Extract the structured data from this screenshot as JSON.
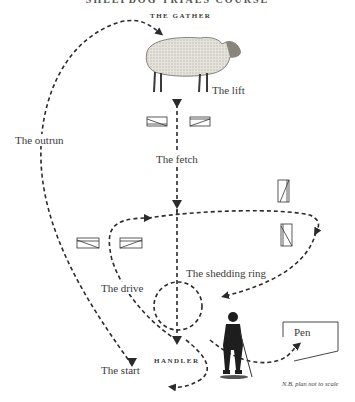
{
  "title": "SHEEPDOG TRIALS COURSE",
  "labels": {
    "gather": "THE GATHER",
    "lift": "The lift",
    "fetch": "The fetch",
    "outrun": "The outrun",
    "drive": "The drive",
    "shedding_ring": "The shedding ring",
    "start": "The start",
    "handler": "HANDLER",
    "pen": "Pen",
    "note": "N.B. plan not to scale"
  },
  "colors": {
    "ink": "#2b2b2b",
    "sheep_wool": "#d9d6cf",
    "handler": "#1e1e1e"
  },
  "obstacles": [
    {
      "name": "fetch-gate-left",
      "x": 147,
      "y": 117,
      "w": 20,
      "h": 9,
      "orientation": "horizontal"
    },
    {
      "name": "fetch-gate-right",
      "x": 190,
      "y": 117,
      "w": 20,
      "h": 9,
      "orientation": "horizontal"
    },
    {
      "name": "drive-gate-left",
      "x": 77,
      "y": 238,
      "w": 22,
      "h": 10,
      "orientation": "horizontal"
    },
    {
      "name": "drive-gate-right",
      "x": 120,
      "y": 238,
      "w": 22,
      "h": 10,
      "orientation": "horizontal"
    },
    {
      "name": "cross-drive-gate-top",
      "x": 278,
      "y": 180,
      "w": 11,
      "h": 22,
      "orientation": "vertical"
    },
    {
      "name": "cross-drive-gate-bottom",
      "x": 281,
      "y": 224,
      "w": 11,
      "h": 22,
      "orientation": "vertical"
    }
  ]
}
